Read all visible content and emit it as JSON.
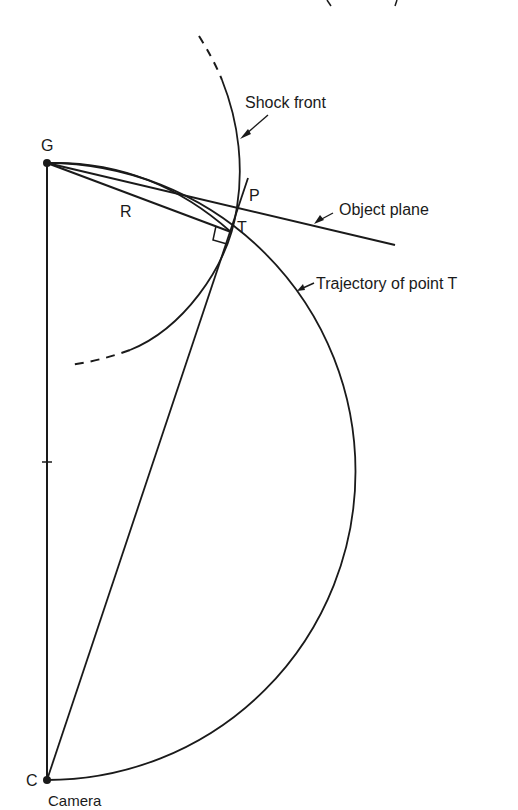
{
  "diagram": {
    "header_fragment": "... of ... p...",
    "labels": {
      "shock_front": "Shock front",
      "object_plane": "Object plane",
      "trajectory": "Trajectory of point T",
      "point_g": "G",
      "point_r": "R",
      "point_p": "P",
      "point_t": "T",
      "point_c": "C",
      "camera": "Camera"
    },
    "points": {
      "G": [
        47,
        163
      ],
      "C": [
        47,
        780
      ],
      "T": [
        231,
        232
      ],
      "P": [
        237,
        207
      ],
      "circle_center": [
        47,
        471
      ]
    },
    "colors": {
      "ink": "#1a1a1a",
      "background": "#ffffff"
    }
  }
}
